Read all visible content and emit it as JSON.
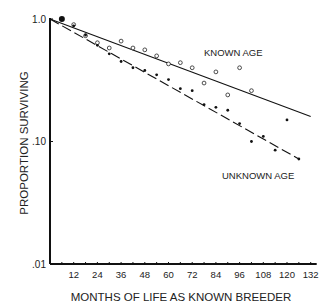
{
  "chart_data": {
    "type": "scatter",
    "title": "",
    "xlabel": "MONTHS OF LIFE AS KNOWN BREEDER",
    "ylabel": "PROPORTION SURVIVING",
    "xlim": [
      0,
      132
    ],
    "ylim": [
      0.01,
      1.0
    ],
    "yscale": "log",
    "x_ticks": [
      12,
      24,
      36,
      48,
      60,
      72,
      84,
      96,
      108,
      120,
      132
    ],
    "y_ticks": [
      {
        "value": 1.0,
        "label": "1.0"
      },
      {
        "value": 0.1,
        "label": ".10"
      },
      {
        "value": 0.01,
        "label": ".01"
      }
    ],
    "grid": false,
    "legend": "inline annotations",
    "series": [
      {
        "name": "KNOWN AGE",
        "marker": "open-circle",
        "line": "solid",
        "x": [
          12,
          18,
          24,
          30,
          36,
          42,
          48,
          54,
          60,
          66,
          72,
          78,
          84,
          90,
          96,
          102
        ],
        "values": [
          0.9,
          0.73,
          0.64,
          0.58,
          0.66,
          0.58,
          0.56,
          0.5,
          0.43,
          0.44,
          0.4,
          0.3,
          0.37,
          0.24,
          0.4,
          0.26
        ],
        "fit_line": {
          "x": [
            0,
            132
          ],
          "y": [
            1.0,
            0.16
          ]
        }
      },
      {
        "name": "UNKNOWN AGE",
        "marker": "filled-dot",
        "line": "dashed",
        "x": [
          12,
          18,
          24,
          30,
          36,
          42,
          48,
          54,
          60,
          66,
          72,
          78,
          84,
          90,
          96,
          102,
          108,
          114,
          120,
          126
        ],
        "values": [
          0.88,
          0.74,
          0.61,
          0.52,
          0.45,
          0.4,
          0.38,
          0.35,
          0.32,
          0.27,
          0.26,
          0.2,
          0.19,
          0.18,
          0.14,
          0.1,
          0.11,
          0.085,
          0.15,
          0.072
        ],
        "fit_line": {
          "x": [
            0,
            126
          ],
          "y": [
            1.0,
            0.072
          ]
        }
      }
    ],
    "annotations": [
      {
        "text": "KNOWN AGE",
        "near_series": "KNOWN AGE"
      },
      {
        "text": "UNKNOWN AGE",
        "near_series": "UNKNOWN AGE"
      }
    ],
    "start_point": {
      "x": 6,
      "y": 1.0
    }
  }
}
